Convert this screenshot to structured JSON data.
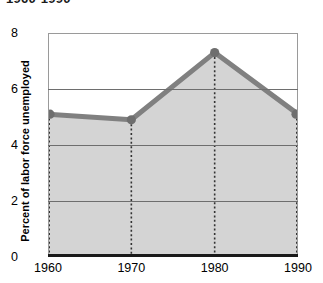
{
  "chart_data": {
    "type": "area",
    "title": "1960-1990",
    "xlabel": "",
    "ylabel": "Percent of labor force unemployed",
    "categories": [
      "1960",
      "1970",
      "1980",
      "1990"
    ],
    "x": [
      1960,
      1970,
      1980,
      1990
    ],
    "values": [
      5.1,
      4.9,
      7.3,
      5.1
    ],
    "series": [
      {
        "name": "Percent of labor force unemployed",
        "values": [
          5.1,
          4.9,
          7.3,
          5.1
        ]
      }
    ],
    "ylim": [
      0,
      8
    ],
    "yticks": [
      0,
      2,
      4,
      6,
      8
    ],
    "ytick_labels": [
      "0",
      "2",
      "4",
      "6",
      "8"
    ],
    "xtick_labels": [
      "1960",
      "1970",
      "1980",
      "1990"
    ],
    "grid": true,
    "grid_axis": "y",
    "legend": false,
    "legend_position": "none",
    "markers": true,
    "droplines": true,
    "colors": {
      "line": "#808080",
      "fill": "#d4d4d4",
      "marker": "#6e6e6e",
      "gridline": "#6e6e6e",
      "axis": "#1a1a1a",
      "frame": "#9a9a9a",
      "text": "#000000",
      "background": "#ffffff"
    }
  },
  "axis": {
    "y_title": "Percent of labor force unemployed",
    "y_labels": [
      "8",
      "6",
      "4",
      "2",
      "0"
    ],
    "x_labels": [
      "1960",
      "1970",
      "1980",
      "1990"
    ]
  },
  "header": {
    "title": "1960-1990"
  }
}
